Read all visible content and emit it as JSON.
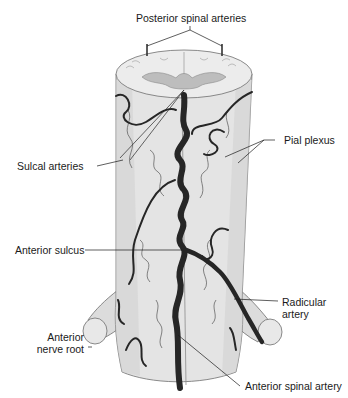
{
  "figure": {
    "type": "anatomical-illustration",
    "colors": {
      "cord_fill": "#e4e4e4",
      "cord_shade": "#cfcfcf",
      "gray_matter": "#bdbdbd",
      "artery": "#262626",
      "outline": "#6e6e6e",
      "background": "#ffffff"
    }
  },
  "labels": {
    "posterior_spinal_arteries": "Posterior spinal arteries",
    "sulcal_arteries": "Sulcal arteries",
    "pial_plexus": "Pial plexus",
    "anterior_sulcus": "Anterior sulcus",
    "radicular_artery_line1": "Radicular",
    "radicular_artery_line2": "artery",
    "anterior_nerve_root_line1": "Anterior",
    "anterior_nerve_root_line2": "nerve root",
    "anterior_spinal_artery": "Anterior spinal artery"
  }
}
